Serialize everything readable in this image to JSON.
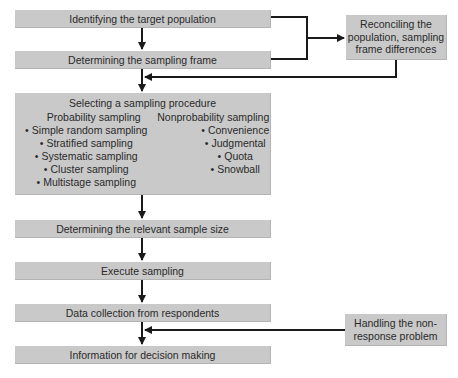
{
  "diagram": {
    "steps": [
      {
        "label": "Identifying the target population"
      },
      {
        "label": "Determining the sampling frame"
      },
      {
        "label": "Selecting a sampling procedure",
        "probability": {
          "heading": "Probability sampling",
          "items": [
            "Simple random sampling",
            "Stratified sampling",
            "Systematic sampling",
            "Cluster sampling",
            "Multistage sampling"
          ]
        },
        "nonprobability": {
          "heading": "Nonprobability sampling",
          "items": [
            "Convenience",
            "Judgmental",
            "Quota",
            "Snowball"
          ]
        }
      },
      {
        "label": "Determining the relevant sample size"
      },
      {
        "label": "Execute sampling"
      },
      {
        "label": "Data collection from respondents"
      },
      {
        "label": "Information for decision making"
      }
    ],
    "side_boxes": {
      "reconcile": {
        "line1": "Reconciling the",
        "line2": "population, sampling",
        "line3": "frame differences"
      },
      "nonresponse": {
        "line1": "Handling the non-",
        "line2": "response problem"
      }
    },
    "colors": {
      "box_fill": "#c9c9c9",
      "line": "#1a1a1a"
    }
  }
}
